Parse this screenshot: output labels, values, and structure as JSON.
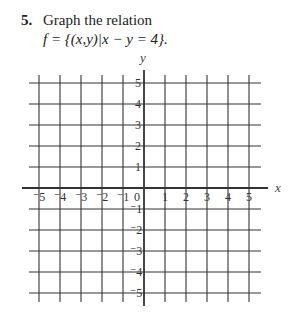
{
  "problem": {
    "number": "5.",
    "instruction": "Graph the relation",
    "relation": "f = {(x,y)|x − y = 4}."
  },
  "chart_data": {
    "type": "scatter",
    "title": "",
    "xlabel": "x",
    "ylabel": "y",
    "xlim": [
      -5,
      5
    ],
    "ylim": [
      -5,
      5
    ],
    "grid": true,
    "x_ticks": [
      -5,
      -4,
      -3,
      -2,
      -1,
      0,
      1,
      2,
      3,
      4,
      5
    ],
    "y_ticks": [
      -5,
      -4,
      -3,
      -2,
      -1,
      1,
      2,
      3,
      4,
      5
    ],
    "x_tick_labels": [
      "⁻5",
      "⁻4",
      "⁻3",
      "⁻2",
      "⁻1",
      "0",
      "1",
      "2",
      "3",
      "4",
      "5"
    ],
    "y_tick_labels": [
      "⁻5",
      "⁻4",
      "⁻3",
      "⁻2",
      "⁻1",
      "1",
      "2",
      "3",
      "4",
      "5"
    ],
    "series": []
  }
}
